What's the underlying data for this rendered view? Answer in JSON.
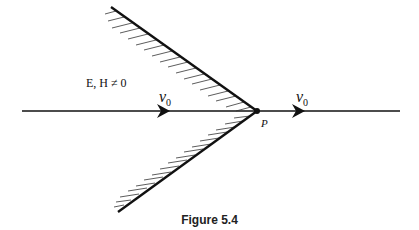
{
  "figure": {
    "caption": "Figure 5.4",
    "field_label": "E, H ≠ 0",
    "velocity_left": {
      "symbol": "v",
      "subscript": "0"
    },
    "velocity_right": {
      "symbol": "v",
      "subscript": "0"
    },
    "vertex_label": "P",
    "colors": {
      "stroke": "#111111",
      "background": "#ffffff"
    }
  }
}
